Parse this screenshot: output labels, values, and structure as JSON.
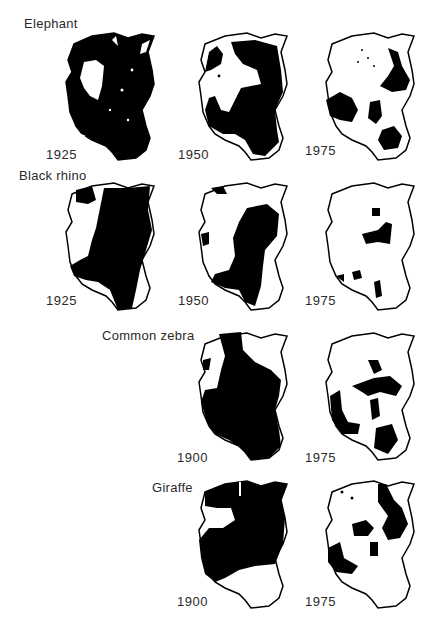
{
  "figure": {
    "legend_meaning": "black = range occupied"
  },
  "rows": [
    {
      "species": "Elephant",
      "maps": [
        {
          "year": "1925",
          "coverage": 0.82
        },
        {
          "year": "1950",
          "coverage": 0.62
        },
        {
          "year": "1975",
          "coverage": 0.28
        }
      ]
    },
    {
      "species": "Black rhino",
      "maps": [
        {
          "year": "1925",
          "coverage": 0.7
        },
        {
          "year": "1950",
          "coverage": 0.4
        },
        {
          "year": "1975",
          "coverage": 0.08
        }
      ]
    },
    {
      "species": "Common zebra",
      "maps": [
        {
          "year": "1900",
          "coverage": 0.78
        },
        {
          "year": "1975",
          "coverage": 0.3
        }
      ]
    },
    {
      "species": "Giraffe",
      "maps": [
        {
          "year": "1900",
          "coverage": 0.72
        },
        {
          "year": "1975",
          "coverage": 0.32
        }
      ]
    }
  ]
}
